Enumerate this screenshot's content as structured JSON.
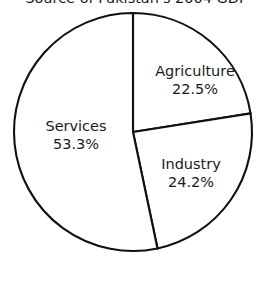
{
  "chart_data": {
    "type": "pie",
    "title": "Source of Pakistan's 2004 GDP",
    "title_clipped": true,
    "categories": [
      "Agriculture",
      "Industry",
      "Services"
    ],
    "values": [
      22.5,
      24.2,
      53.3
    ],
    "value_suffix": "%",
    "slices": [
      {
        "label": "Agriculture",
        "value": 22.5,
        "value_text": "22.5%",
        "start_angle_deg": 0,
        "end_angle_deg": 81,
        "fill": "#ffffff",
        "stroke": "#111111"
      },
      {
        "label": "Industry",
        "value": 24.2,
        "value_text": "24.2%",
        "start_angle_deg": 81,
        "end_angle_deg": 168.12,
        "fill": "#ffffff",
        "stroke": "#111111"
      },
      {
        "label": "Services",
        "value": 53.3,
        "value_text": "53.3%",
        "start_angle_deg": 168.12,
        "end_angle_deg": 360,
        "fill": "#ffffff",
        "stroke": "#111111"
      }
    ],
    "geometry": {
      "center_x": 133,
      "center_y": 132,
      "radius": 119,
      "start_at_twelve_oclock": true,
      "direction": "clockwise"
    },
    "legend": "none",
    "grid": false,
    "xlabel": "",
    "ylabel": ""
  }
}
